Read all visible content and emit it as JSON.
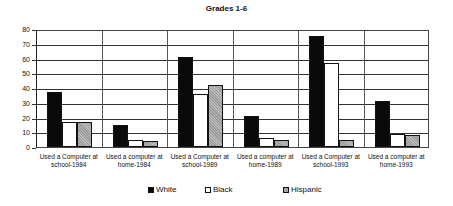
{
  "chart_data": {
    "type": "bar",
    "title": "Grades 1-6",
    "xlabel": "",
    "ylabel": "",
    "ylim": [
      0,
      80
    ],
    "yticks": [
      0,
      10,
      20,
      30,
      40,
      50,
      60,
      70,
      80
    ],
    "grid": true,
    "legend_position": "bottom",
    "categories": [
      "Used a Computer at school-1984",
      "Used a computer at home-1984",
      "Used a Computer at school-1989",
      "Used a computer at home-1989",
      "Used a Computer at school-1993",
      "Used a computer at home-1993"
    ],
    "category_lines": [
      [
        "Used a Computer at",
        "school-1984"
      ],
      [
        "Used a computer at",
        "home-1984"
      ],
      [
        "Used a Computer at",
        "school-1989"
      ],
      [
        "Used a computer at",
        "home-1989"
      ],
      [
        "Used a Computer at",
        "school-1993"
      ],
      [
        "Used a computer at",
        "home-1993"
      ]
    ],
    "series": [
      {
        "name": "White",
        "color": "#0a0a0a",
        "values": [
          37,
          15,
          61,
          21,
          75,
          31
        ]
      },
      {
        "name": "Black",
        "color": "#ffffff",
        "values": [
          17,
          5,
          36,
          6,
          57,
          9
        ]
      },
      {
        "name": "Hispanic",
        "color": "#aaaaaa",
        "values": [
          17,
          4,
          42,
          5,
          5,
          8
        ]
      }
    ]
  },
  "labels": {
    "title": "Grades 1-6",
    "yticks": [
      "0",
      "10",
      "20",
      "30",
      "40",
      "50",
      "60",
      "70",
      "80"
    ],
    "legend": [
      "White",
      "Black",
      "Hispanic"
    ]
  }
}
